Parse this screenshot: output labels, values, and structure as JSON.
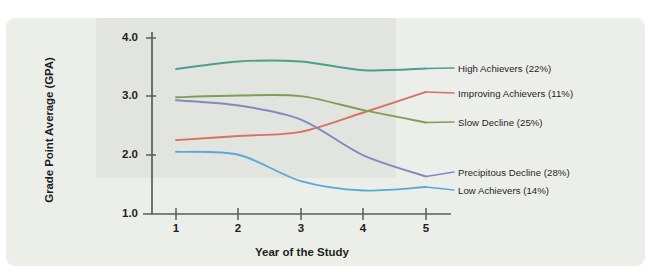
{
  "chart_data": {
    "type": "line",
    "title": "",
    "xlabel": "Year of the Study",
    "ylabel": "Grade Point Average (GPA)",
    "x": [
      1,
      2,
      3,
      4,
      5
    ],
    "xtick_labels": [
      "1",
      "2",
      "3",
      "4",
      "5"
    ],
    "ytick_labels": [
      "1.0",
      "2.0",
      "3.0",
      "4.0"
    ],
    "ytick_values": [
      1.0,
      2.0,
      3.0,
      4.0
    ],
    "xlim": [
      0.72,
      5.0
    ],
    "ylim": [
      1.0,
      4.1
    ],
    "grid": false,
    "legend_position": "right-of-line-ends",
    "series": [
      {
        "name": "High Achievers (22%)",
        "label": "High Achievers (22%)",
        "color": "#4d9e8e",
        "values": [
          3.47,
          3.6,
          3.6,
          3.45,
          3.48
        ]
      },
      {
        "name": "Improving Achievers (11%)",
        "label": "Improving Achievers (11%)",
        "color": "#d9705f",
        "values": [
          2.26,
          2.33,
          2.4,
          2.73,
          3.08
        ]
      },
      {
        "name": "Slow Decline (25%)",
        "label": "Slow Decline (25%)",
        "color": "#7f9e55",
        "values": [
          2.99,
          3.02,
          3.01,
          2.77,
          2.56
        ]
      },
      {
        "name": "Precipitous Decline (28%)",
        "label": "Precipitous Decline (28%)",
        "color": "#8289bd",
        "values": [
          2.94,
          2.85,
          2.61,
          2.0,
          1.64
        ]
      },
      {
        "name": "Low Achievers (14%)",
        "label": "Low Achievers (14%)",
        "color": "#5aa8d8",
        "values": [
          2.06,
          2.01,
          1.56,
          1.4,
          1.46
        ]
      }
    ]
  },
  "axes": {
    "y_title": "Grade Point Average (GPA)",
    "x_title": "Year of the Study",
    "y_ticks": [
      "4.0",
      "3.0",
      "2.0",
      "1.0"
    ],
    "x_ticks": [
      "1",
      "2",
      "3",
      "4",
      "5"
    ]
  },
  "labels": {
    "high_achievers": "High Achievers (22%)",
    "improving_achievers": "Improving Achievers (11%)",
    "slow_decline": "Slow Decline (25%)",
    "precipitous_decline": "Precipitous Decline (28%)",
    "low_achievers": "Low Achievers (14%)"
  },
  "colors": {
    "panel_background": "#eceeea",
    "page_background": "#ffffff",
    "axis": "#5b5b5b",
    "text": "#1e1e1e",
    "high_achievers": "#4d9e8e",
    "improving_achievers": "#d9705f",
    "slow_decline": "#7f9e55",
    "precipitous_decline": "#8289bd",
    "low_achievers": "#5aa8d8"
  }
}
